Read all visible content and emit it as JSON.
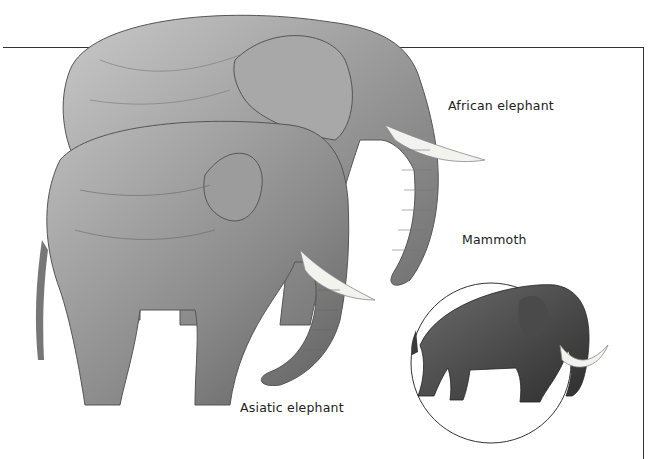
{
  "labels": {
    "african": "African elephant",
    "asiatic": "Asiatic elephant",
    "mammoth": "Mammoth"
  },
  "colors": {
    "frame": "#333333",
    "label": "#222222",
    "elephant_gray": "#8a8a8a",
    "mammoth_dark": "#3a3a3a",
    "tusk": "#f2f2ee"
  }
}
